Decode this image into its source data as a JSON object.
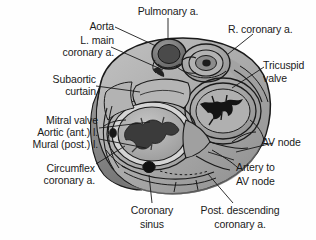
{
  "figure": {
    "kind": "anatomical-illustration",
    "style": "grayscale line drawing with shading",
    "background_color": "#fefefe",
    "line_color": "#1a1a1a"
  },
  "labels": {
    "pulmonary_artery": "Pulmonary a.",
    "aorta": "Aorta",
    "l_main_coronary_line1": "L. main",
    "l_main_coronary_line2": "coronary a.",
    "subaortic_line1": "Subaortic",
    "subaortic_line2": "curtain",
    "mitral_valve": "Mitral valve",
    "aortic_ant_leaflet": "Aortic (ant.) l.",
    "mural_post_leaflet": "Mural (post.) l.",
    "circumflex_line1": "Circumflex",
    "circumflex_line2": "coronary a.",
    "coronary_sinus_line1": "Coronary",
    "coronary_sinus_line2": "sinus",
    "post_descending_line1": "Post. descending",
    "post_descending_line2": "coronary a.",
    "artery_to_av_node_line1": "Artery to",
    "artery_to_av_node_line2": "AV node",
    "av_node": "AV node",
    "tricuspid_line1": "Tricuspid",
    "tricuspid_line2": "valve",
    "r_coronary": "R. coronary a."
  },
  "structures": {
    "aortic_root": "aortic-root-cross-section",
    "pulmonary_trunk": "pulmonary-trunk-cross-section",
    "mitral_orifice": "mitral-valve-orifice",
    "tricuspid_orifice": "tricuspid-valve-orifice",
    "coronary_sinus_ostium": "coronary-sinus-ostium",
    "circumflex_vessel": "circumflex-artery-cross-section",
    "av_node_region": "av-node-region"
  },
  "colors": {
    "myocardium_light": "#b9b9b9",
    "myocardium_mid": "#a2a2a2",
    "myocardium_dark": "#8a8a8a",
    "myocardium_deep": "#6f6f6f",
    "annulus_pale": "#d6d6d6",
    "orifice_dark": "#2b2b2b",
    "outline": "#1a1a1a"
  }
}
